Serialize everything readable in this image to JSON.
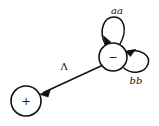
{
  "diagram": {
    "type": "state-transition-diagram",
    "background_color": "#ffffff",
    "ink_color": "#111111",
    "width": 159,
    "height": 126,
    "nodes": [
      {
        "id": "minus-state",
        "label": "−",
        "label_name": "minus-sign",
        "cx": 113,
        "cy": 57,
        "r": 14
      },
      {
        "id": "plus-state",
        "label": "+",
        "label_name": "plus-sign",
        "cx": 26,
        "cy": 101,
        "r": 15
      }
    ],
    "edges": [
      {
        "id": "loop-aa",
        "from": "minus-state",
        "to": "minus-state",
        "label": "aa",
        "label_x": 117,
        "label_y": 10,
        "kind": "self-loop-top"
      },
      {
        "id": "loop-bb",
        "from": "minus-state",
        "to": "minus-state",
        "label": "bb",
        "label_x": 136,
        "label_y": 80,
        "kind": "self-loop-right"
      },
      {
        "id": "edge-lambda",
        "from": "minus-state",
        "to": "plus-state",
        "label": "Λ",
        "label_x": 64,
        "label_y": 66,
        "kind": "straight"
      }
    ]
  }
}
